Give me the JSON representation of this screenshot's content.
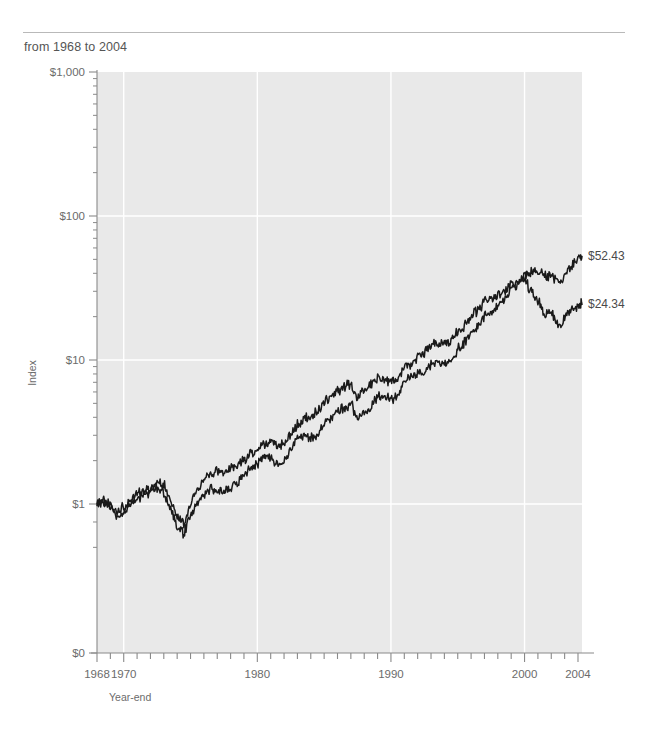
{
  "header": {
    "subtitle": "from 1968 to 2004"
  },
  "chart_data": {
    "type": "line",
    "title": "",
    "subtitle": "from 1968 to 2004",
    "xlabel": "Year-end",
    "ylabel": "Index",
    "yscale": "log",
    "ylim": [
      0.25,
      1000
    ],
    "xlim": [
      1968,
      2004.3
    ],
    "grid": true,
    "legend": "inline-annotations",
    "ytick_labels": [
      "$1,000",
      "$100",
      "$10",
      "$1",
      "$0"
    ],
    "ytick_values": [
      1000,
      100,
      10,
      1,
      0
    ],
    "xtick_labels": [
      "1968",
      "1970",
      "1980",
      "1990",
      "2000",
      "2004"
    ],
    "xtick_values": [
      1968,
      1970,
      1980,
      1990,
      2000,
      2004
    ],
    "minor_xticks": "every year",
    "minor_yticks": "log decade subdivisions",
    "colors": {
      "line": "#1a1a1a",
      "plot_background": "#e9e9e9",
      "gridline": "#ffffff",
      "axis": "#8a8a8a",
      "text": "#5a5a5a"
    },
    "x": [
      1968,
      1968.5,
      1969,
      1969.5,
      1970,
      1970.5,
      1971,
      1971.5,
      1972,
      1972.5,
      1973,
      1973.5,
      1974,
      1974.5,
      1975,
      1975.5,
      1976,
      1976.5,
      1977,
      1977.5,
      1978,
      1978.5,
      1979,
      1979.5,
      1980,
      1980.5,
      1981,
      1981.5,
      1982,
      1982.5,
      1983,
      1983.5,
      1984,
      1984.5,
      1985,
      1985.5,
      1986,
      1986.5,
      1987,
      1987.5,
      1988,
      1988.5,
      1989,
      1989.5,
      1990,
      1990.5,
      1991,
      1991.5,
      1992,
      1992.5,
      1993,
      1993.5,
      1994,
      1994.5,
      1995,
      1995.5,
      1996,
      1996.5,
      1997,
      1997.5,
      1998,
      1998.5,
      1999,
      1999.5,
      2000,
      2000.5,
      2001,
      2001.5,
      2002,
      2002.5,
      2003,
      2003.5,
      2004,
      2004.3
    ],
    "series": [
      {
        "name": "All Value Stocks",
        "end_label": "$52.43",
        "end_value": 52.43,
        "start_value": 1.0,
        "values": [
          1.0,
          1.05,
          1.02,
          0.88,
          0.95,
          1.05,
          1.18,
          1.22,
          1.3,
          1.42,
          1.38,
          1.08,
          0.84,
          0.72,
          1.02,
          1.22,
          1.48,
          1.62,
          1.7,
          1.66,
          1.78,
          1.88,
          2.05,
          2.25,
          2.38,
          2.62,
          2.7,
          2.52,
          2.55,
          3.05,
          3.62,
          3.9,
          4.05,
          4.35,
          5.1,
          5.6,
          6.2,
          6.45,
          6.9,
          5.6,
          6.3,
          6.8,
          7.6,
          7.4,
          7.1,
          7.35,
          8.8,
          9.2,
          10.4,
          11.1,
          12.6,
          13.3,
          13.4,
          13.6,
          16.0,
          17.6,
          20.2,
          21.8,
          25.5,
          27.0,
          28.5,
          29.8,
          33.0,
          35.0,
          39.0,
          42.0,
          41.5,
          38.0,
          39.0,
          33.5,
          38.0,
          45.0,
          50.0,
          52.43
        ]
      },
      {
        "name": "All Growth Stocks",
        "end_label": "$24.34",
        "end_value": 24.34,
        "start_value": 1.0,
        "values": [
          1.0,
          1.02,
          0.96,
          0.82,
          0.86,
          0.98,
          1.12,
          1.14,
          1.22,
          1.3,
          1.2,
          0.92,
          0.7,
          0.62,
          0.86,
          1.0,
          1.18,
          1.26,
          1.28,
          1.24,
          1.32,
          1.42,
          1.58,
          1.75,
          1.9,
          2.15,
          2.12,
          1.92,
          1.95,
          2.4,
          2.9,
          2.95,
          2.88,
          3.0,
          3.6,
          3.95,
          4.45,
          4.55,
          5.05,
          3.95,
          4.4,
          4.7,
          5.6,
          5.4,
          5.3,
          5.6,
          7.0,
          7.5,
          8.0,
          8.3,
          9.2,
          9.5,
          9.4,
          9.6,
          11.8,
          13.2,
          15.5,
          16.8,
          20.0,
          21.5,
          24.5,
          26.5,
          31.0,
          33.5,
          35.5,
          30.0,
          25.5,
          21.0,
          22.0,
          17.0,
          19.5,
          22.5,
          24.0,
          24.34
        ]
      }
    ]
  },
  "annotations": [
    {
      "text": "All Value Stocks",
      "x": 1985.5,
      "y": 27
    },
    {
      "text": "All Growth Stocks",
      "x": 1988.5,
      "y": 5.6
    }
  ]
}
